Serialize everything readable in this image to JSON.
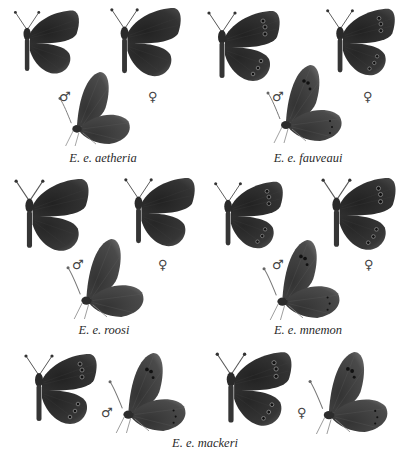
{
  "plate": {
    "background": "#ffffff",
    "wing_dark": "#2b2b2b",
    "wing_mid": "#3a3a3a",
    "wing_light": "#555555"
  },
  "symbols": {
    "male": "♂",
    "female": "♀"
  },
  "groups": [
    {
      "caption": "E. e. aetheria"
    },
    {
      "caption": "E. e. fauveaui"
    },
    {
      "caption": "E. e. roosi"
    },
    {
      "caption": "E. e. mnemon"
    },
    {
      "caption": "E. e. mackeri"
    }
  ]
}
